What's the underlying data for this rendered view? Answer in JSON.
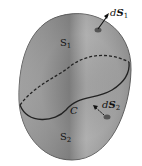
{
  "diagram": {
    "labels": {
      "s1": {
        "main": "S",
        "sub": "1"
      },
      "s2": {
        "main": "S",
        "sub": "2"
      },
      "curve": "C",
      "ds1": {
        "d": "d",
        "main": "S",
        "sub": "1"
      },
      "ds2": {
        "d": "d",
        "main": "S",
        "sub": "2"
      }
    },
    "colors": {
      "surface": "#9a9a9a",
      "surface_dark": "#6e6e6e",
      "surface_light": "#c8c8c8",
      "outline": "#222222"
    }
  }
}
